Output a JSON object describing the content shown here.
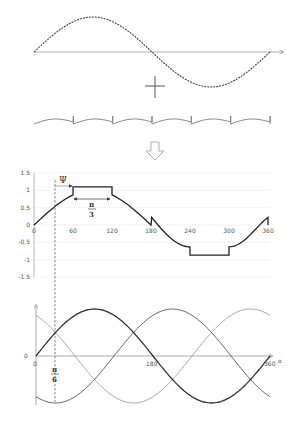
{
  "diagram": {
    "colors": {
      "background": "#ffffff",
      "fundamental": "#444444",
      "harmonic": "#888888",
      "result": "#222222",
      "phase_a": "#333333",
      "phase_b": "#666666",
      "phase_c": "#aaaaaa",
      "grid": "#eeeeee",
      "axis": "#999999"
    },
    "top": {
      "operator": "+",
      "arrow": "down-arrow"
    },
    "result_chart": {
      "y_ticks": [
        "1.5",
        "1",
        "0.5",
        "0",
        "-0.5",
        "-1",
        "-1.5"
      ],
      "x_ticks": [
        "0",
        "60",
        "120",
        "180",
        "240",
        "300",
        "360"
      ],
      "annotations": {
        "psi": "Ψ",
        "pi": "π",
        "three": "3"
      }
    },
    "three_phase_chart": {
      "y_label": "0",
      "x_ticks": [
        "0",
        "180",
        "360"
      ],
      "x_unit": "o",
      "annotations": {
        "pi": "π",
        "six": "6"
      }
    }
  },
  "chart_data": [
    {
      "type": "line",
      "title": "Fundamental sine",
      "x": [
        0,
        45,
        90,
        135,
        180,
        225,
        270,
        315,
        360
      ],
      "values": [
        0,
        0.71,
        1,
        0.71,
        0,
        -0.71,
        -1,
        -0.71,
        0
      ],
      "style": "dashed"
    },
    {
      "type": "line",
      "title": "Injected harmonic (sawtooth-like ripple)",
      "periods": 6,
      "style": "solid"
    },
    {
      "type": "line",
      "title": "Resulting modulating waveform",
      "x": [
        0,
        30,
        60,
        60,
        120,
        120,
        150,
        180,
        180,
        210,
        240,
        240,
        300,
        300,
        330,
        360,
        360
      ],
      "values": [
        0,
        0.5,
        0.87,
        1.1,
        1.1,
        0.87,
        0.5,
        0,
        0.2,
        -0.5,
        -0.63,
        -0.87,
        -0.87,
        -0.63,
        -0.5,
        0.2,
        0
      ],
      "xlabel": "",
      "ylabel": "",
      "ylim": [
        -1.5,
        1.5
      ],
      "xlim": [
        0,
        360
      ],
      "x_ticks": [
        0,
        60,
        120,
        180,
        240,
        300,
        360
      ],
      "y_ticks": [
        1.5,
        1,
        0.5,
        0,
        -0.5,
        -1,
        -1.5
      ],
      "annotations": [
        "Ψ",
        "π/3"
      ],
      "grid": true
    },
    {
      "type": "line",
      "title": "Three-phase sinusoids",
      "series": [
        {
          "name": "phase A",
          "function": "sin(x)"
        },
        {
          "name": "phase B",
          "function": "sin(x-120)"
        },
        {
          "name": "phase C",
          "function": "sin(x+120)"
        }
      ],
      "x_ticks": [
        0,
        180,
        360
      ],
      "xlim": [
        0,
        360
      ],
      "annotations": [
        "π/6"
      ]
    }
  ]
}
